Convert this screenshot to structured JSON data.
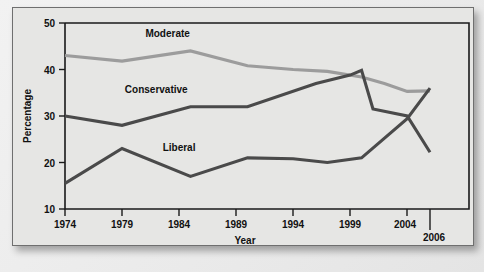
{
  "chart_data": {
    "type": "line",
    "title": "",
    "xlabel": "Year",
    "ylabel": "Percentage",
    "xlim": [
      1974,
      2006
    ],
    "ylim": [
      10,
      50
    ],
    "yticks": [
      10,
      20,
      30,
      40,
      50
    ],
    "xticks": [
      1974,
      1979,
      1984,
      1989,
      1994,
      1999,
      2004,
      2006
    ],
    "ytick_labels": [
      "10",
      "20",
      "30",
      "40",
      "50"
    ],
    "xtick_labels": [
      "1974",
      "1979",
      "1984",
      "1989",
      "1994",
      "1999",
      "2004",
      "2006"
    ],
    "grid": false,
    "legend": "inline-labels",
    "series": [
      {
        "name": "Moderate",
        "color": "#9c9c9c",
        "x": [
          1974,
          1979,
          1985,
          1990,
          1994,
          1997,
          2000,
          2002,
          2004,
          2006
        ],
        "values": [
          43.0,
          41.8,
          44.0,
          40.8,
          40.0,
          39.6,
          38.4,
          37.0,
          35.3,
          35.4
        ]
      },
      {
        "name": "Conservative",
        "color": "#4a4a4a",
        "x": [
          1974,
          1979,
          1985,
          1990,
          1996,
          1999,
          2000,
          2001,
          2004,
          2006
        ],
        "values": [
          30.0,
          28.0,
          32.0,
          32.0,
          37.0,
          38.8,
          39.8,
          31.5,
          30.0,
          22.2
        ]
      },
      {
        "name": "Liberal",
        "color": "#4a4a4a",
        "x": [
          1974,
          1979,
          1985,
          1990,
          1994,
          1997,
          2000,
          2004,
          2006
        ],
        "values": [
          15.5,
          23.0,
          17.0,
          21.0,
          20.8,
          20.0,
          21.0,
          29.4,
          36.0
        ]
      }
    ],
    "annotations": [
      {
        "text": "Moderate",
        "x": 1983,
        "y": 47.0
      },
      {
        "text": "Conservative",
        "x": 1982,
        "y": 35.0
      },
      {
        "text": "Liberal",
        "x": 1984,
        "y": 22.5
      }
    ]
  },
  "axes": {
    "y_title": "Percentage",
    "x_title": "Year"
  }
}
